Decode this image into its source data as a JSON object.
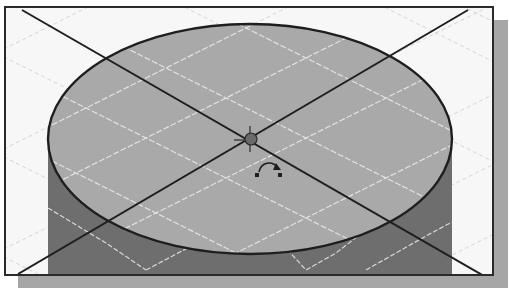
{
  "viewport": {
    "label": "3D model viewport",
    "model": "cylinder",
    "view": "isometric",
    "colors": {
      "background": "#f7f7f7",
      "top_face": "#a9a9a9",
      "side_face": "#6e6e6e",
      "grid": "#e0e0e0",
      "edge": "#1e1e1e",
      "axis": "#1e1e1e",
      "frame": "#2a2a2a",
      "shadow": "#a6a6a6"
    }
  },
  "icons": {
    "center_point": "center-point-icon",
    "rotate_cursor": "rotate-arrow-icon"
  }
}
